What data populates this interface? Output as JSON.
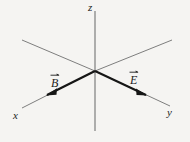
{
  "figure": {
    "type": "3d-axes-vector-diagram",
    "background_color": "#f5f4f2",
    "ink_color": "#1d1d1d",
    "axis_color": "#8a8a8a",
    "axes": [
      {
        "name": "z",
        "label": "z",
        "orientation": "vertical",
        "label_position": "top"
      },
      {
        "name": "x",
        "label": "x",
        "orientation": "diagonal-lower-left",
        "label_position": "bottom-left"
      },
      {
        "name": "y",
        "label": "y",
        "orientation": "diagonal-lower-right",
        "label_position": "bottom-right"
      }
    ],
    "vectors": [
      {
        "name": "B",
        "label": "B",
        "accent": "vector-arrow",
        "direction": "toward-lower-left-along-x-axis",
        "arrowhead": "present"
      },
      {
        "name": "E",
        "label": "E",
        "accent": "vector-arrow",
        "direction": "toward-lower-right-along-y-axis",
        "arrowhead": "present"
      }
    ],
    "origin": {
      "x": 95,
      "y": 71
    }
  }
}
